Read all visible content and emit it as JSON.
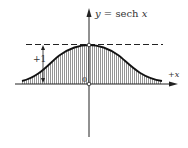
{
  "figure": {
    "function_label": "y = sech x",
    "function_label_parts": {
      "y": "y",
      "eq": " = sech ",
      "x": "x"
    },
    "x_axis_label": "+x",
    "x_axis_label_parts": {
      "sign": "+",
      "var": "x"
    },
    "origin_label": "0",
    "height_label": "+1",
    "asymptote": "y = 1 (dashed)",
    "shading": "vertical hatching under curve"
  },
  "colors": {
    "ink": "#222222",
    "hatch": "#555555",
    "background": "#ffffff"
  }
}
